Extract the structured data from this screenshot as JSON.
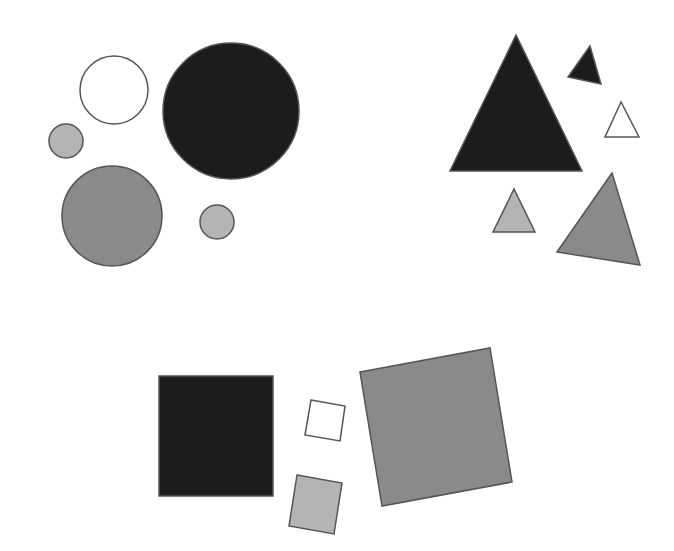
{
  "diagram": {
    "width": 674,
    "height": 551,
    "background": "#ffffff",
    "stroke": "#555555",
    "colors": {
      "black": "#1c1c1c",
      "gray": "#8a8a8a",
      "light_gray": "#b4b4b4",
      "white": "#ffffff"
    },
    "groups": [
      {
        "name": "circles",
        "shapes": [
          {
            "type": "circle",
            "cx": 114,
            "cy": 90,
            "r": 34,
            "fill": "white"
          },
          {
            "type": "circle",
            "cx": 231,
            "cy": 111,
            "r": 68,
            "fill": "black"
          },
          {
            "type": "circle",
            "cx": 66,
            "cy": 141,
            "r": 17,
            "fill": "light_gray"
          },
          {
            "type": "circle",
            "cx": 112,
            "cy": 216,
            "r": 50,
            "fill": "gray"
          },
          {
            "type": "circle",
            "cx": 217,
            "cy": 222,
            "r": 17,
            "fill": "light_gray"
          }
        ]
      },
      {
        "name": "triangles",
        "shapes": [
          {
            "type": "polygon",
            "points": "516,35 450,171 582,171",
            "fill": "black"
          },
          {
            "type": "polygon",
            "points": "590,46 568,77 601,84",
            "fill": "black"
          },
          {
            "type": "polygon",
            "points": "621,102 605,137 639,137",
            "fill": "white"
          },
          {
            "type": "polygon",
            "points": "514,189 493,232 535,232",
            "fill": "light_gray"
          },
          {
            "type": "polygon",
            "points": "612,173 557,252 640,265",
            "fill": "gray"
          }
        ]
      },
      {
        "name": "squares",
        "shapes": [
          {
            "type": "polygon",
            "points": "159,376 273,376 273,496 159,496",
            "fill": "black"
          },
          {
            "type": "polygon",
            "points": "311,400 345,406 340,441 305,435",
            "fill": "white"
          },
          {
            "type": "polygon",
            "points": "297,475 342,483 334,534 289,526",
            "fill": "light_gray"
          },
          {
            "type": "polygon",
            "points": "360,372 490,348 512,482 382,506",
            "fill": "gray"
          }
        ]
      }
    ]
  }
}
